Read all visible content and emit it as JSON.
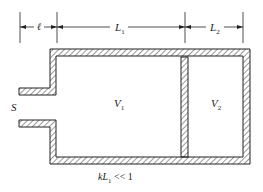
{
  "diagram": {
    "title": "",
    "dimensions": [
      {
        "id": "l",
        "label": "ℓ",
        "sub": ""
      },
      {
        "id": "L1",
        "label": "L",
        "sub": "1"
      },
      {
        "id": "L2",
        "label": "L",
        "sub": "2"
      }
    ],
    "regions": [
      {
        "id": "S",
        "label": "S",
        "sub": ""
      },
      {
        "id": "V1",
        "label": "V",
        "sub": "1"
      },
      {
        "id": "V2",
        "label": "V",
        "sub": "2"
      }
    ],
    "caption": {
      "prefix": "kL",
      "sub": "1",
      "suffix": " << 1"
    },
    "colors": {
      "line": "#222222",
      "hatch": "#333333",
      "background": "#ffffff"
    }
  }
}
